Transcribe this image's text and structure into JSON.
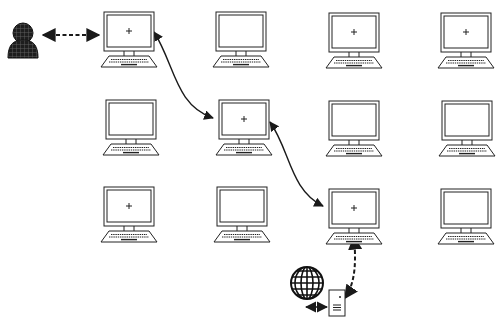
{
  "diagram": {
    "colors": {
      "stroke": "#1a1a1a",
      "fill": "#ffffff",
      "user": "#262626",
      "grid": "#555555"
    },
    "user": {
      "x": 8,
      "y": 25,
      "label": "user"
    },
    "computers": [
      {
        "id": "r1c1",
        "row": 1,
        "col": 1,
        "x": 100,
        "y": 11,
        "crosshair": true
      },
      {
        "id": "r1c2",
        "row": 1,
        "col": 2,
        "x": 212,
        "y": 11,
        "crosshair": false
      },
      {
        "id": "r1c3",
        "row": 1,
        "col": 3,
        "x": 325,
        "y": 12,
        "crosshair": true
      },
      {
        "id": "r1c4",
        "row": 1,
        "col": 4,
        "x": 437,
        "y": 12,
        "crosshair": true
      },
      {
        "id": "r2c1",
        "row": 2,
        "col": 1,
        "x": 102,
        "y": 99,
        "crosshair": false
      },
      {
        "id": "r2c2",
        "row": 2,
        "col": 2,
        "x": 215,
        "y": 99,
        "crosshair": true
      },
      {
        "id": "r2c3",
        "row": 2,
        "col": 3,
        "x": 325,
        "y": 100,
        "crosshair": false
      },
      {
        "id": "r2c4",
        "row": 2,
        "col": 4,
        "x": 438,
        "y": 100,
        "crosshair": false
      },
      {
        "id": "r3c1",
        "row": 3,
        "col": 1,
        "x": 100,
        "y": 186,
        "crosshair": true
      },
      {
        "id": "r3c2",
        "row": 3,
        "col": 2,
        "x": 213,
        "y": 186,
        "crosshair": false
      },
      {
        "id": "r3c3",
        "row": 3,
        "col": 3,
        "x": 325,
        "y": 188,
        "crosshair": true
      },
      {
        "id": "r3c4",
        "row": 3,
        "col": 4,
        "x": 437,
        "y": 188,
        "crosshair": false
      }
    ],
    "connections": [
      {
        "from": "user",
        "to": "r1c1",
        "style": "dashed",
        "bidirectional": true
      },
      {
        "from": "r1c1",
        "to": "r2c2",
        "style": "solid-curve",
        "bidirectional": true
      },
      {
        "from": "r2c2",
        "to": "r3c3",
        "style": "solid-curve",
        "bidirectional": true
      },
      {
        "from": "r3c3",
        "to": "server",
        "style": "dashed-curve",
        "bidirectional": true
      },
      {
        "from": "server",
        "to": "internet",
        "style": "dashed",
        "bidirectional": true
      }
    ],
    "server": {
      "x": 328,
      "y": 289,
      "label": "server"
    },
    "internet": {
      "x": 303,
      "y": 280,
      "label": "globe"
    }
  }
}
